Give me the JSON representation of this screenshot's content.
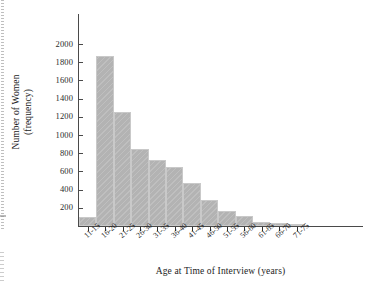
{
  "chart_data": {
    "type": "bar",
    "title": "",
    "subtitle": "",
    "xlabel": "Age at Time of Interview (years)",
    "ylabel_line1": "Number of Women",
    "ylabel_line2": "(frequency)",
    "categories": [
      "11-15",
      "16-20",
      "21-25",
      "26-30",
      "31-35",
      "36-40",
      "41-45",
      "46-50",
      "51-55",
      "56-60",
      "61-65",
      "66-70",
      "71-75"
    ],
    "values": [
      95,
      1870,
      1255,
      845,
      720,
      645,
      475,
      285,
      160,
      105,
      45,
      30,
      20
    ],
    "ytick_labels": [
      "200",
      "400",
      "600",
      "800",
      "1000",
      "1200",
      "1400",
      "1600",
      "1800",
      "2000"
    ],
    "ytick_values": [
      200,
      400,
      600,
      800,
      1000,
      1200,
      1400,
      1600,
      1800,
      2000
    ],
    "ylim": [
      0,
      2060
    ],
    "grid": false,
    "legend": null,
    "bar_color": "#b3b3b3",
    "bar_edge_color": "#c9c9c9",
    "axis_color": "#4a4a4a"
  }
}
